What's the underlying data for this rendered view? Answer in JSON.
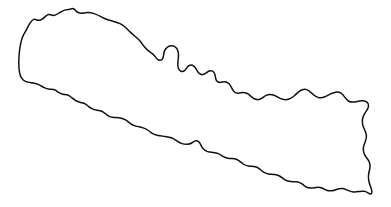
{
  "figure": {
    "kind": "map-outline",
    "caption": "",
    "width": 391,
    "height": 207,
    "background_color": "#ffffff",
    "outline_color": "#111111",
    "fill_color": "#ffffff",
    "outline_width_px": 1.5,
    "has_labels": false,
    "has_internal_borders": false,
    "has_legend": false,
    "has_scale_bar": false,
    "has_compass": false
  },
  "map": {
    "name": "country-outline-nepal",
    "description": "Single closed boundary outline of Nepal, elongated northwest to southeast, drawn as a thin black line on white with no internal divisions or labels.",
    "orientation": "north-up",
    "extent_px": {
      "min_x": 18,
      "min_y": 8,
      "max_x": 374,
      "max_y": 194
    },
    "shape_notes": [
      "Northwest corner peaks near x=70,y=9 with two small notches along the northern ridge",
      "Westernmost point near x=19,y=76",
      "Distinctive square notch in the northern border near x=175-200, y=45-62",
      "Jagged stepped northeastern border descending from x=205,y=70 to x=290,y=110",
      "Rounded hump on the east-northeast near x=303,y=102",
      "Wavy eastern edge between y=110 and y=185 near x=355-374",
      "Southeast corner near x=368,y=190",
      "Southern border rises gently westward with small undulations",
      "Southwest boundary climbs diagonally back to the western point"
    ],
    "outline_path": "M 70.5 9.2 C 66 9.0 62.5 10.6 59.5 12.6 C 57.2 14.1 55.6 15.7 53.4 15.4 C 51.6 15.2 50.0 14.2 48.4 14.6 C 46.2 15.1 44.8 17.2 43.0 18.6 C 41.4 19.9 39.6 20.6 37.8 20.3 C 36.2 20.0 35.0 19.0 33.6 19.4 C 32.0 19.9 31.0 21.7 30.0 23.2 C 28.6 25.3 27.6 27.6 26.4 29.8 C 25.4 31.7 24.4 33.2 23.4 35.2 C 22.2 37.6 21.4 40.2 20.8 42.8 C 20.1 45.8 19.7 48.8 19.4 51.9 C 19.0 55.6 18.8 59.3 18.8 63.0 C 18.8 66.2 19.0 69.3 19.5 72.4 C 19.9 74.8 20.6 76.7 21.6 78.2 C 22.6 79.7 23.9 80.7 25.4 81.4 C 27.2 82.2 29.2 82.5 31.2 82.8 C 33.8 83.2 36.4 83.6 38.8 84.6 C 40.6 85.4 42.1 86.5 43.8 87.4 C 45.6 88.4 47.6 89.0 49.6 89.2 C 51.4 89.4 53.0 89.2 54.6 89.8 C 56.0 90.3 57.0 91.3 58.2 92.2 C 59.6 93.2 61.2 93.9 62.9 94.2 C 64.4 94.5 65.8 94.4 67.2 94.8 C 68.6 95.2 69.7 96.1 70.9 97.0 C 72.4 98.2 73.8 99.4 75.4 100.4 C 77.0 101.4 78.8 102.0 80.6 102.4 C 82.2 102.8 83.8 103.0 85.2 103.8 C 86.5 104.5 87.5 105.6 88.7 106.6 C 90.2 107.8 91.8 108.8 93.6 109.4 C 95.4 110.0 97.2 110.2 99.0 110.6 C 100.8 111.0 102.5 111.6 104.0 112.6 C 105.5 113.6 106.7 114.9 108.2 115.8 C 109.9 116.8 111.8 117.2 113.7 117.4 C 115.8 117.6 117.9 117.6 120.0 117.9 C 122.0 118.2 123.9 118.8 125.6 119.9 C 127.2 120.9 128.5 122.2 130.0 123.3 C 131.8 124.6 133.8 125.5 135.9 126.1 C 138.0 126.7 140.2 127.0 142.3 127.6 C 144.2 128.1 146.0 128.9 147.6 130.0 C 149.2 131.1 150.6 132.4 152.2 133.4 C 154.0 134.5 156.0 135.1 158.1 135.5 C 160.4 135.9 162.7 136.1 165.0 136.4 C 167.2 136.7 169.4 137.0 171.4 137.8 C 173.2 138.5 174.8 139.6 176.4 140.6 C 178.2 141.8 180.0 142.9 182.0 143.6 C 183.8 144.2 185.6 144.4 187.4 144.3 C 189.0 144.2 190.4 143.8 191.8 143.0 C 193.0 142.3 194.0 141.3 195.2 140.9 C 196.4 140.5 197.6 140.8 198.6 141.6 C 199.6 142.4 200.2 143.6 200.8 144.8 C 201.5 146.2 202.2 147.6 203.2 148.8 C 204.4 150.2 205.9 151.1 207.6 151.6 C 209.4 152.1 211.2 152.2 213.0 152.4 C 215.0 152.6 217.0 152.9 218.8 153.8 C 220.4 154.6 221.8 155.8 223.4 156.7 C 225.2 157.7 227.2 158.2 229.2 158.4 C 231.0 158.6 232.8 158.5 234.6 158.8 C 236.3 159.1 237.8 159.8 239.2 160.8 C 240.6 161.8 241.8 163.0 243.2 164.0 C 244.8 165.1 246.6 165.7 248.5 166.0 C 250.4 166.3 252.3 166.3 254.2 166.6 C 256.0 166.9 257.7 167.5 259.2 168.6 C 260.6 169.6 261.8 170.9 263.2 171.9 C 264.8 173.0 266.6 173.6 268.5 173.9 C 270.6 174.2 272.7 174.2 274.8 174.5 C 276.8 174.8 278.7 175.4 280.4 176.5 C 282.0 177.5 283.4 178.8 285.0 179.8 C 286.7 180.9 288.6 181.4 290.6 181.6 C 292.6 181.8 294.6 181.6 296.6 181.8 C 298.4 182.0 300.1 182.6 301.6 183.6 C 303.0 184.5 304.2 185.7 305.6 186.6 C 307.2 187.6 309.0 188.0 310.8 188.0 C 312.6 188.0 314.4 187.6 316.2 187.4 C 318.2 187.2 320.2 187.3 322.0 188.0 C 323.6 188.6 325.0 189.6 326.6 190.2 C 328.4 190.9 330.4 191.0 332.3 190.7 C 334.0 190.4 335.6 189.7 337.2 189.2 C 339.0 188.6 340.9 188.3 342.8 188.6 C 344.6 188.9 346.2 189.7 347.8 190.4 C 349.6 191.2 351.4 191.8 353.3 192.0 C 355.2 192.2 357.1 191.9 359.0 191.6 C 360.8 191.3 362.6 191.0 364.4 191.3 C 365.9 191.6 367.2 192.4 368.4 193.2 C 369.4 193.9 370.4 194.4 371.2 193.8 C 372.0 193.2 372.0 192.0 371.8 190.8 C 371.5 189.0 370.8 187.4 370.2 185.7 C 369.5 183.7 368.9 181.7 368.6 179.6 C 368.3 177.4 368.4 175.2 368.8 173.0 C 369.2 171.0 369.8 169.1 370.0 167.1 C 370.2 165.1 369.9 163.1 369.0 161.3 C 368.2 159.7 367.0 158.4 366.0 157.0 C 364.9 155.4 364.0 153.7 363.6 151.8 C 363.2 150.0 363.2 148.2 363.6 146.4 C 364.0 144.6 364.8 143.0 365.4 141.3 C 366.1 139.4 366.6 137.4 366.4 135.4 C 366.2 133.4 365.4 131.6 364.6 129.8 C 363.8 128.0 363.0 126.2 362.6 124.3 C 362.2 122.4 362.2 120.4 362.6 118.5 C 363.0 116.6 363.8 114.9 364.8 113.3 C 365.8 111.7 367.0 110.3 367.8 108.6 C 368.5 107.1 368.8 105.3 368.2 103.8 C 367.6 102.3 366.2 101.4 364.7 101.0 C 363.0 100.5 361.2 100.6 359.5 100.9 C 357.6 101.2 355.8 101.8 353.9 102.0 C 352.0 102.2 350.0 102.0 348.4 101.0 C 347.0 100.1 346.0 98.7 345.0 97.4 C 343.8 95.8 342.6 94.2 341.0 93.2 C 339.4 92.2 337.4 91.9 335.5 92.2 C 333.6 92.5 331.8 93.3 330.1 94.2 C 328.2 95.2 326.4 96.3 324.4 97.0 C 322.4 97.7 320.2 97.9 318.2 97.4 C 316.4 96.9 314.8 95.9 313.4 94.7 C 311.9 93.4 310.6 91.9 309.0 90.8 C 307.4 89.7 305.4 89.1 303.4 89.4 C 301.6 89.7 300.0 90.7 298.6 91.8 C 297.1 93.0 295.8 94.4 294.4 95.7 C 292.8 97.1 291.0 98.3 289.0 99.0 C 287.0 99.7 284.8 99.8 282.8 99.3 C 281.0 98.9 279.4 98.0 277.8 97.1 C 276.0 96.1 274.2 95.2 272.2 94.8 C 270.2 94.4 268.0 94.6 266.2 95.4 C 264.6 96.1 263.4 97.3 262.0 98.2 C 260.4 99.2 258.6 99.8 256.8 99.6 C 255.2 99.4 253.8 98.6 252.5 97.6 C 251.0 96.5 249.8 95.2 248.4 94.2 C 246.9 93.1 245.2 92.4 243.4 92.4 C 241.8 92.4 240.3 93.0 238.8 93.2 C 237.2 93.4 235.6 93.0 234.4 92.0 C 233.2 91.0 232.5 89.6 231.8 88.2 C 231.0 86.6 230.2 85.0 229.0 83.8 C 227.8 82.6 226.2 81.8 224.5 81.8 C 223.0 81.8 221.6 82.4 220.2 82.4 C 218.8 82.4 217.4 81.8 216.6 80.7 C 215.8 79.6 215.6 78.2 215.4 76.8 C 215.2 75.2 214.9 73.6 214.0 72.4 C 213.1 71.2 211.6 70.6 210.1 70.8 C 208.8 71.0 207.7 71.8 206.6 72.6 C 205.4 73.5 204.2 74.4 202.8 74.6 C 201.5 74.8 200.2 74.3 199.2 73.4 C 198.2 72.5 197.5 71.3 196.8 70.1 C 196.0 68.7 195.2 67.3 194.0 66.3 C 192.8 65.3 191.2 64.8 189.8 65.2 C 188.6 65.5 187.7 66.4 187.0 67.4 C 186.2 68.5 185.6 69.8 184.6 70.6 C 183.6 71.4 182.2 71.7 181.0 71.2 C 179.9 70.8 179.1 69.8 178.6 68.7 C 178.0 67.4 177.8 66.0 177.8 64.6 C 177.8 62.8 178.0 61.0 178.2 59.2 C 178.4 57.2 178.6 55.2 178.4 53.2 C 178.2 51.4 177.7 49.6 176.6 48.2 C 175.5 46.8 173.8 45.9 172.0 45.8 C 170.4 45.7 168.8 46.2 167.5 47.1 C 166.2 48.0 165.2 49.2 164.6 50.6 C 164.0 52.0 163.8 53.6 163.6 55.1 C 163.4 56.6 163.1 58.2 162.2 59.2 C 161.3 60.2 159.8 60.5 158.6 60.0 C 157.4 59.5 156.6 58.4 155.8 57.4 C 154.8 56.1 153.8 54.8 152.6 53.8 C 151.2 52.6 149.6 51.8 148.2 50.7 C 146.6 49.4 145.2 47.9 144.0 46.3 C 142.7 44.6 141.6 42.8 140.2 41.2 C 138.8 39.6 137.2 38.2 135.6 36.8 C 133.9 35.3 132.2 33.9 130.6 32.4 C 128.8 30.7 127.2 28.9 125.4 27.3 C 123.6 25.7 121.6 24.4 119.5 23.4 C 117.4 22.4 115.2 21.8 113.0 21.2 C 110.8 20.6 108.6 20.1 106.5 19.3 C 104.4 18.5 102.4 17.4 100.4 16.4 C 98.3 15.3 96.2 14.3 94.0 13.6 C 91.8 12.9 89.5 12.5 87.2 12.6 C 85.2 12.7 83.3 13.2 81.4 13.2 C 79.6 13.2 77.8 12.7 76.6 11.6 C 75.6 10.7 75.0 9.5 74.0 9.0 C 72.9 8.4 71.6 8.6 70.5 9.2 Z"
  }
}
